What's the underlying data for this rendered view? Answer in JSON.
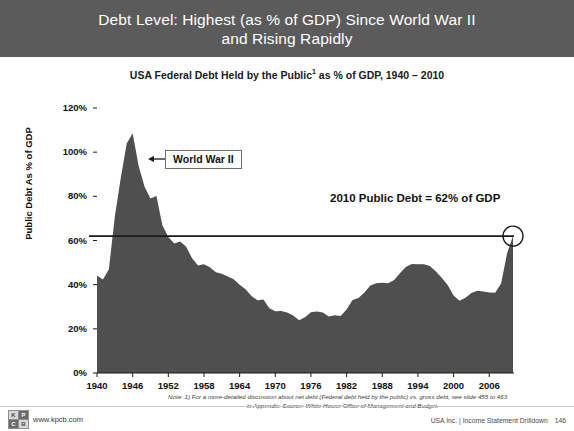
{
  "slide": {
    "title_line_1": "Debt Level: Highest (as % of GDP) Since World War II",
    "title_line_2": "and Rising Rapidly",
    "title_full": "Debt Level: Highest (as % of GDP) Since World War II\nand Rising Rapidly",
    "banner_color": "#5b5b5b"
  },
  "chart_data": {
    "type": "area",
    "title_main": "USA Federal Debt Held by the Public",
    "title_superscript": "1",
    "title_tail": " as % of GDP, 1940 – 2010",
    "xlabel": "",
    "ylabel": "Public Debt As % of GDP",
    "xlim": [
      1940,
      2010
    ],
    "ylim": [
      0,
      120
    ],
    "grid": false,
    "legend": "none",
    "series_color": "#4f4f4f",
    "y_ticks": [
      "0%",
      "20%",
      "40%",
      "60%",
      "80%",
      "100%",
      "120%"
    ],
    "y_tick_values": [
      0,
      20,
      40,
      60,
      80,
      100,
      120
    ],
    "x_ticks": [
      "1940",
      "1946",
      "1952",
      "1958",
      "1964",
      "1970",
      "1976",
      "1982",
      "1988",
      "1994",
      "2000",
      "2006"
    ],
    "x_tick_values": [
      1940,
      1946,
      1952,
      1958,
      1964,
      1970,
      1976,
      1982,
      1988,
      1994,
      2000,
      2006
    ],
    "reference_line": {
      "value": 62,
      "label": "2010 Public Debt = 62% of GDP",
      "color": "#1a1a1a"
    },
    "end_marker": {
      "x": 2010,
      "y": 62,
      "shape": "circle",
      "color": "#1a1a1a"
    },
    "annotations": [
      {
        "text": "World War II",
        "x": 1946,
        "y": 95,
        "arrow": "left"
      },
      {
        "text": "2010 Public Debt = 62% of GDP",
        "x": 1990,
        "y": 72
      }
    ],
    "x": [
      1940,
      1941,
      1942,
      1943,
      1944,
      1945,
      1946,
      1947,
      1948,
      1949,
      1950,
      1951,
      1952,
      1953,
      1954,
      1955,
      1956,
      1957,
      1958,
      1959,
      1960,
      1961,
      1962,
      1963,
      1964,
      1965,
      1966,
      1967,
      1968,
      1969,
      1970,
      1971,
      1972,
      1973,
      1974,
      1975,
      1976,
      1977,
      1978,
      1979,
      1980,
      1981,
      1982,
      1983,
      1984,
      1985,
      1986,
      1987,
      1988,
      1989,
      1990,
      1991,
      1992,
      1993,
      1994,
      1995,
      1996,
      1997,
      1998,
      1999,
      2000,
      2001,
      2002,
      2003,
      2004,
      2005,
      2006,
      2007,
      2008,
      2009,
      2010
    ],
    "values": [
      44.2,
      42.3,
      47.0,
      70.9,
      88.3,
      103.9,
      108.6,
      93.9,
      84.3,
      79.0,
      80.2,
      66.9,
      61.6,
      58.6,
      59.5,
      57.2,
      52.0,
      48.7,
      49.2,
      47.9,
      45.6,
      45.0,
      43.7,
      42.4,
      40.0,
      37.9,
      34.9,
      32.9,
      33.3,
      29.3,
      28.0,
      28.1,
      27.4,
      26.0,
      23.9,
      25.3,
      27.5,
      27.8,
      27.4,
      25.6,
      26.1,
      25.8,
      28.7,
      33.1,
      34.0,
      36.4,
      39.6,
      40.6,
      40.9,
      40.6,
      42.1,
      45.3,
      48.1,
      49.4,
      49.3,
      49.2,
      48.5,
      46.1,
      43.1,
      39.8,
      35.1,
      32.7,
      34.1,
      36.2,
      37.3,
      36.9,
      36.5,
      36.3,
      40.5,
      54.1,
      62.2
    ]
  },
  "footnote": {
    "line_1": "Note: 1) For a more-detailed discussion about net debt (Federal debt held by the public) vs. gross debt, see slide 455 to 463",
    "line_2": "in Appendix. Source: White House Office of Management and Budget."
  },
  "footer": {
    "kpcb_url": "www.kpcb.com",
    "logo_letters": [
      "K",
      "P",
      "C",
      "B"
    ],
    "source_label": "USA Inc. | Income Statement Drilldown",
    "page_number": "146"
  }
}
